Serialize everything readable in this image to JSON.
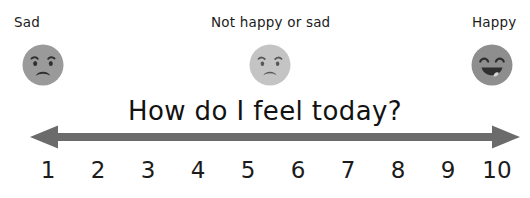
{
  "question": "How do I feel today?",
  "anchors": [
    {
      "id": "sad",
      "label": "Sad",
      "face": "sad-face-icon"
    },
    {
      "id": "mid",
      "label": "Not happy or sad",
      "face": "neutral-sad-face-icon"
    },
    {
      "id": "happy",
      "label": "Happy",
      "face": "happy-face-icon"
    }
  ],
  "scale": {
    "numbers": [
      "1",
      "2",
      "3",
      "4",
      "5",
      "6",
      "7",
      "8",
      "9",
      "10"
    ],
    "min": "1",
    "max": "10"
  },
  "arrow": {
    "name": "double-headed-arrow-icon",
    "direction": "both"
  },
  "colors": {
    "text": "#1b1b1b",
    "question_text": "#121212",
    "arrow": "#6b6b6b",
    "face_sad": "#9a9a9a",
    "face_neutral": "#c4c4c4",
    "face_happy": "#8e8e8e",
    "face_features": "#2f2f2f",
    "background": "#ffffff"
  }
}
